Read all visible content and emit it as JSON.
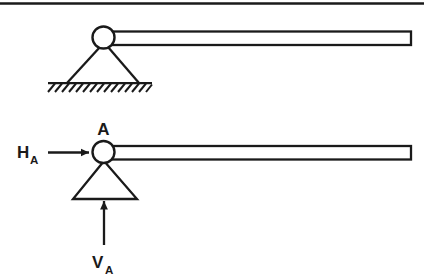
{
  "figure": {
    "background_color": "#ffffff",
    "stroke_color": "#1a1a1a",
    "width": 424,
    "height": 279
  },
  "top_rule": {
    "name": "top-horizontal-rule"
  },
  "diagram_top": {
    "name": "beam-on-pin-support-top",
    "beam": {
      "name": "beam-top"
    },
    "pin": {
      "name": "pin-circle-top"
    },
    "support": {
      "name": "triangular-support-top"
    },
    "ground": {
      "name": "hatched-ground-top"
    }
  },
  "diagram_bottom": {
    "name": "beam-with-reactions-bottom",
    "beam": {
      "name": "beam-bottom"
    },
    "pin": {
      "name": "pin-circle-bottom"
    },
    "support": {
      "name": "triangular-support-bottom"
    },
    "labels": {
      "joint": "A",
      "horizontal_reaction": "H",
      "horizontal_reaction_sub": "A",
      "vertical_reaction": "V",
      "vertical_reaction_sub": "A"
    },
    "arrows": {
      "horizontal": "horizontal-reaction-arrow",
      "vertical": "vertical-reaction-arrow"
    }
  }
}
